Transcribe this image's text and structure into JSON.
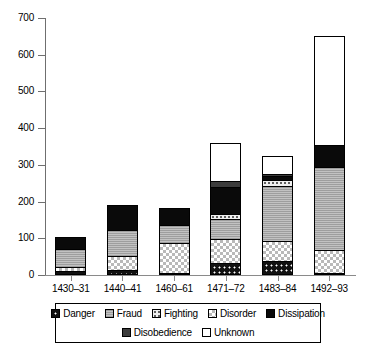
{
  "chart_data": {
    "type": "bar",
    "title": "",
    "subtitle": "",
    "xlabel": "",
    "ylabel": "",
    "stacked": true,
    "grid": false,
    "legend_position": "bottom",
    "ylim": [
      0,
      700
    ],
    "yticks": [
      0,
      100,
      200,
      300,
      400,
      500,
      600,
      700
    ],
    "ytick_labels": [
      "0",
      "100",
      "200",
      "300",
      "400",
      "500",
      "600",
      "700"
    ],
    "categories": [
      "1430–31",
      "1440–41",
      "1460–61",
      "1471–72",
      "1483–84",
      "1492–93"
    ],
    "series": [
      {
        "name": "Danger",
        "fill": "f-danger",
        "values": [
          10,
          14,
          4,
          34,
          38,
          6
        ]
      },
      {
        "name": "Fraud",
        "fill": "f-fraud",
        "values": [
          48,
          73,
          49,
          53,
          150,
          225
        ]
      },
      {
        "name": "Fighting",
        "fill": "f-fighting",
        "values": [
          0,
          0,
          0,
          14,
          17,
          0
        ]
      },
      {
        "name": "Disorder",
        "fill": "f-disorder",
        "values": [
          13,
          37,
          82,
          65,
          55,
          62
        ]
      },
      {
        "name": "Dissipation",
        "fill": "f-dissipation",
        "values": [
          33,
          68,
          45,
          75,
          10,
          60
        ]
      },
      {
        "name": "Disobedience",
        "fill": "f-disobedience",
        "values": [
          0,
          0,
          0,
          14,
          6,
          0
        ]
      },
      {
        "name": "Unknown",
        "fill": "f-unknown",
        "values": [
          0,
          0,
          0,
          105,
          49,
          297
        ]
      }
    ],
    "stack_order": [
      "Danger",
      "Disorder",
      "Fraud",
      "Fighting",
      "Dissipation",
      "Disobedience",
      "Unknown"
    ],
    "totals": [
      104,
      192,
      180,
      360,
      325,
      650
    ]
  },
  "legend": {
    "row1": [
      {
        "label": "Danger",
        "fill": "f-danger"
      },
      {
        "label": "Fraud",
        "fill": "f-fraud"
      },
      {
        "label": "Fighting",
        "fill": "f-fighting"
      },
      {
        "label": "Disorder",
        "fill": "f-disorder"
      },
      {
        "label": "Dissipation",
        "fill": "f-dissipation"
      }
    ],
    "row2": [
      {
        "label": "Disobedience",
        "fill": "f-disobedience"
      },
      {
        "label": "Unknown",
        "fill": "f-unknown"
      }
    ]
  },
  "colors": {
    "axis": "#6f6f6f",
    "text": "#000000",
    "background": "#ffffff",
    "danger": "#111111",
    "fraud": "#a8a8a8",
    "fighting": "#efefef",
    "disorder": "#ffffff",
    "dissipation": "#0a0a0a",
    "disobedience": "#3c3c3c",
    "unknown": "#ffffff"
  }
}
